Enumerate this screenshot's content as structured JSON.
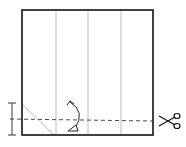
{
  "diagram": {
    "square_panels": 4,
    "colors": {
      "outline": "#111111",
      "crease": "#aaaaaa",
      "dash": "#333333"
    },
    "icons": [
      "scissors-icon",
      "fold-arrow-icon",
      "dimension-marker-icon"
    ]
  }
}
